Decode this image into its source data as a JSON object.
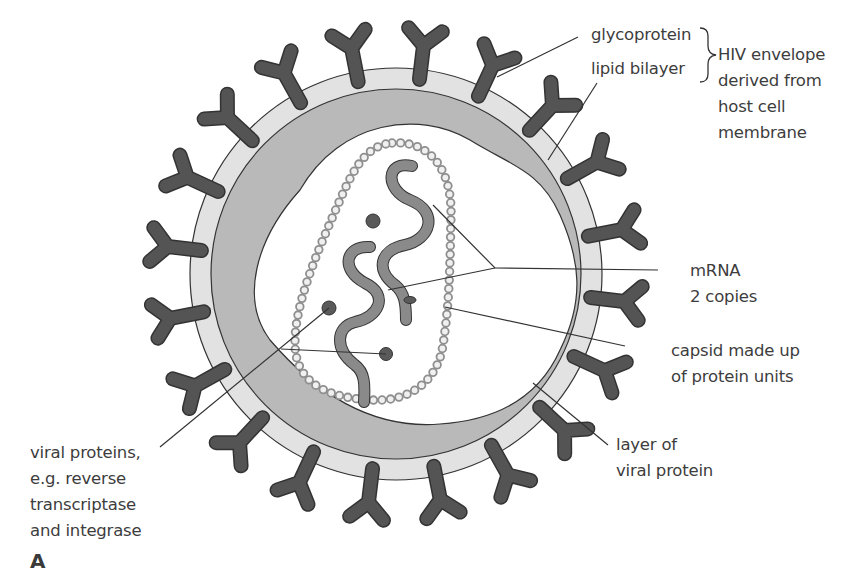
{
  "figure": {
    "panel_label": "A",
    "labels": {
      "glycoprotein": "glycoprotein",
      "lipid_bilayer": "lipid bilayer",
      "envelope": [
        "HIV envelope",
        "derived from",
        "host cell",
        "membrane"
      ],
      "mrna": [
        "mRNA",
        "2 copies"
      ],
      "capsid": [
        "capsid made up",
        "of protein units"
      ],
      "viral_protein_layer": [
        "layer of",
        "viral protein"
      ],
      "viral_proteins": [
        "viral proteins,",
        "e.g. reverse",
        "transcriptase",
        "and integrase"
      ]
    },
    "colors": {
      "glycoprotein": "#545454",
      "lipid_bilayer": "#e2e2e2",
      "protein_layer": "#b9b9b9",
      "capsid_unit": "#9a9a9a",
      "mrna": "#8a8a8a",
      "enzyme": "#5a5a5a",
      "leader_line": "#333333"
    }
  }
}
